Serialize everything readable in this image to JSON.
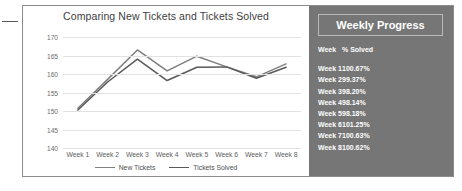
{
  "chart_data": {
    "type": "line",
    "title": "Comparing New Tickets and Tickets Solved",
    "xlabel": "",
    "ylabel": "",
    "ylim": [
      140,
      172
    ],
    "yticks": [
      170,
      165,
      160,
      155,
      150,
      145,
      140
    ],
    "grid": true,
    "legend_position": "bottom",
    "categories": [
      "Week 1",
      "Week 2",
      "Week 3",
      "Week 4",
      "Week 5",
      "Week 6",
      "Week 7",
      "Week 8"
    ],
    "series": [
      {
        "name": "New Tickets",
        "color": "#7f7f7f",
        "values": [
          150.8,
          158.6,
          166.6,
          160.9,
          164.9,
          162.0,
          159.3,
          162.8
        ]
      },
      {
        "name": "Tickets Solved",
        "color": "#595959",
        "values": [
          150.3,
          157.9,
          164.1,
          158.3,
          161.9,
          162.0,
          158.9,
          161.9
        ]
      }
    ]
  },
  "progress": {
    "title": "Weekly Progress",
    "columns": [
      "Week",
      "% Solved"
    ],
    "rows": [
      {
        "week": "Week 1",
        "pct": "100.67%"
      },
      {
        "week": "Week 2",
        "pct": "99.37%"
      },
      {
        "week": "Week 3",
        "pct": "98.20%"
      },
      {
        "week": "Week 4",
        "pct": "98.14%"
      },
      {
        "week": "Week 5",
        "pct": "98.18%"
      },
      {
        "week": "Week 6",
        "pct": "101.25%"
      },
      {
        "week": "Week 7",
        "pct": "100.63%"
      },
      {
        "week": "Week 8",
        "pct": "100.62%"
      }
    ]
  },
  "colors": {
    "panel_border": "#8c8c8c",
    "progress_background": "#767676",
    "gridline": "#e2e2e2",
    "series_new_tickets": "#7f7f7f",
    "series_tickets_solved": "#595959"
  }
}
